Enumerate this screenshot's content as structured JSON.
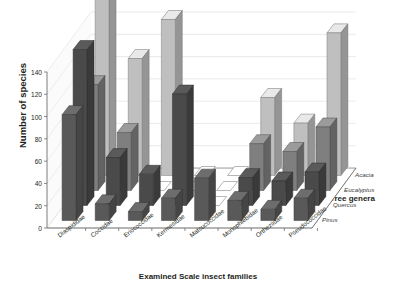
{
  "chart_data": {
    "type": "bar",
    "subtype": "3d-clustered-column",
    "title": "",
    "xlabel": "Examined Scale insect families",
    "ylabel": "Number of species",
    "zlabel": "Tree genera",
    "ylim": [
      0,
      140
    ],
    "yticks": [
      0,
      20,
      40,
      60,
      80,
      100,
      120,
      140
    ],
    "grid": true,
    "legend_position": "top",
    "categories": [
      "Diaspididae",
      "Coccidae",
      "Eriococcidae",
      "Kermesidae",
      "Matsucoccidae",
      "Monophlebidae",
      "Ortheziidae",
      "Pseudococcidae"
    ],
    "depth_categories": [
      "Pinus",
      "Quercus",
      "Eucalyptus",
      "Acacia"
    ],
    "series": [
      {
        "name": "Pinus",
        "color": "#595959",
        "values": [
          95,
          15,
          8,
          20,
          38,
          18,
          10,
          20
        ]
      },
      {
        "name": "Quercus",
        "color": "#4a4a4a",
        "values": [
          140,
          43,
          28,
          100,
          0,
          25,
          22,
          30
        ]
      },
      {
        "name": "Eucalyptus",
        "color": "#7f7f7f",
        "values": [
          95,
          52,
          0,
          0,
          0,
          42,
          35,
          57
        ]
      },
      {
        "name": "Acacia",
        "color": "#bfbfbf",
        "values": [
          158,
          105,
          140,
          0,
          0,
          70,
          47,
          128
        ]
      }
    ]
  },
  "legend": {
    "items": [
      {
        "label": "Pinus"
      },
      {
        "label": "Quercus"
      },
      {
        "label": "Eucalyptus"
      },
      {
        "label": "Acacia"
      }
    ]
  },
  "axes": {
    "y_title": "Number of species",
    "x_title": "Examined Scale insect families",
    "z_title": "Tree genera",
    "y_ticks": [
      "0",
      "20",
      "40",
      "60",
      "80",
      "100",
      "120",
      "140"
    ],
    "x_ticks": [
      "Diaspididae",
      "Coccidae",
      "Eriococcidae",
      "Kermesidae",
      "Matsucoccidae",
      "Monophlebidae",
      "Ortheziidae",
      "Pseudococcidae"
    ],
    "z_ticks": [
      "Pinus",
      "Quercus",
      "Eucalyptus",
      "Acacia"
    ]
  }
}
